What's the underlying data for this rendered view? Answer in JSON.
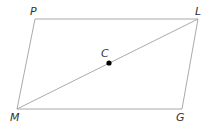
{
  "diagram": {
    "type": "parallelogram",
    "vertices": [
      {
        "id": "P",
        "label": "P",
        "x": 35,
        "y": 19
      },
      {
        "id": "L",
        "label": "L",
        "x": 198,
        "y": 19
      },
      {
        "id": "G",
        "label": "G",
        "x": 182,
        "y": 109
      },
      {
        "id": "M",
        "label": "M",
        "x": 17,
        "y": 109
      }
    ],
    "diagonal": {
      "from": "M",
      "to": "L"
    },
    "point": {
      "id": "C",
      "label": "C",
      "x": 109,
      "y": 63
    },
    "colors": {
      "line": "#a0a0a0",
      "point": "#000000",
      "text": "#333333"
    }
  }
}
